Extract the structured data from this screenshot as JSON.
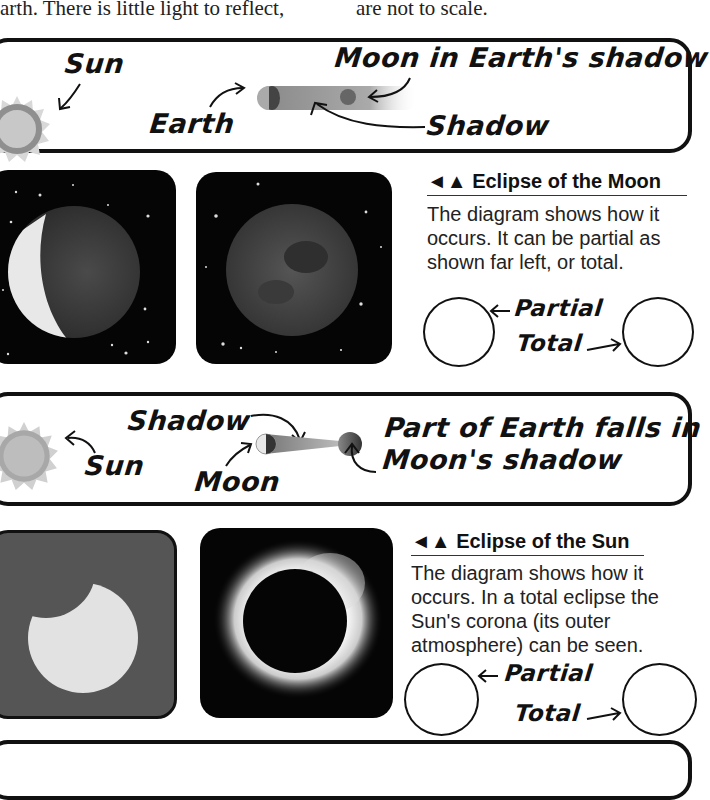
{
  "intro_text": {
    "left": "arth. There is little light to reflect,",
    "right": "are not to scale."
  },
  "lunar_diagram": {
    "sun_label": "Sun",
    "earth_label": "Earth",
    "moon_label": "Moon in Earth's shadow",
    "shadow_label": "Shadow"
  },
  "lunar_photos": {
    "partial_alt": "Partial lunar eclipse",
    "total_alt": "Total lunar eclipse"
  },
  "lunar_caption": {
    "marker": "◄▲",
    "title": "Eclipse of the Moon",
    "body": "The diagram shows how it occurs. It can be partial as shown far left, or total.",
    "partial_label": "Partial",
    "total_label": "Total"
  },
  "solar_diagram": {
    "shadow_label": "Shadow",
    "sun_label": "Sun",
    "moon_label": "Moon",
    "earth_label_line1": "Part of Earth falls in",
    "earth_label_line2": "Moon's shadow"
  },
  "solar_caption": {
    "marker": "◄▲",
    "title": "Eclipse of the Sun",
    "body": "The diagram shows how it occurs. In a total eclipse the Sun's corona (its outer atmosphere) can be seen.",
    "partial_label": "Partial",
    "total_label": "Total"
  },
  "colors": {
    "ink": "#111111",
    "sun_fill": "#bdbdbd",
    "partial_sun_bg": "#555555",
    "night_sky": "#050505"
  }
}
